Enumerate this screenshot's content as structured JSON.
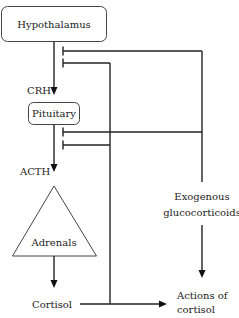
{
  "diagram": {
    "nodes": {
      "hypothalamus": "Hypothalamus",
      "pituitary": "Pituitary",
      "adrenals": "Adrenals",
      "cortisol": "Cortisol",
      "exogenous_line1": "Exogenous",
      "exogenous_line2": "glucocorticoids",
      "actions_line1": "Actions of",
      "actions_line2": "cortisol"
    },
    "edge_labels": {
      "crh": "CRH",
      "acth": "ACTH"
    },
    "edges": [
      {
        "from": "Hypothalamus",
        "to": "Pituitary",
        "label": "CRH",
        "type": "stimulate"
      },
      {
        "from": "Pituitary",
        "to": "Adrenals",
        "label": "ACTH",
        "type": "stimulate"
      },
      {
        "from": "Adrenals",
        "to": "Cortisol",
        "type": "stimulate"
      },
      {
        "from": "Cortisol",
        "to": "Actions of cortisol",
        "type": "stimulate"
      },
      {
        "from": "Exogenous glucocorticoids",
        "to": "Actions of cortisol",
        "type": "stimulate"
      },
      {
        "from": "Cortisol",
        "to": "Hypothalamus",
        "type": "inhibit"
      },
      {
        "from": "Cortisol",
        "to": "Pituitary",
        "type": "inhibit"
      },
      {
        "from": "Exogenous glucocorticoids",
        "to": "Hypothalamus",
        "type": "inhibit"
      },
      {
        "from": "Exogenous glucocorticoids",
        "to": "Pituitary",
        "type": "inhibit"
      }
    ],
    "colors": {
      "line": "#222222",
      "box_border": "#444444",
      "background": "#ffffff"
    }
  }
}
